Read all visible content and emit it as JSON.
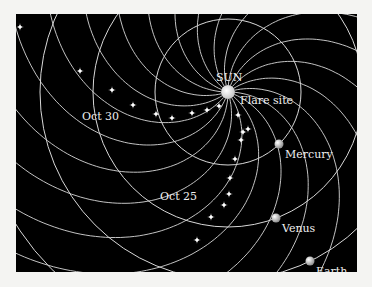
{
  "diagram": {
    "background": "#000000",
    "line_color": "#d8d8d8",
    "sun": {
      "label": "SUN",
      "cx": 228,
      "cy": 92,
      "r": 7,
      "color": "#e8e8e8"
    },
    "flare_label": "Flare site",
    "orbits": [
      {
        "name": "Mercury",
        "r": 73
      },
      {
        "name": "Venus",
        "r": 135
      },
      {
        "name": "Earth",
        "r": 188
      },
      {
        "name": "",
        "r": 250
      }
    ],
    "planets": [
      {
        "label": "Mercury",
        "x": 279,
        "y": 144
      },
      {
        "label": "Venus",
        "x": 276,
        "y": 218
      },
      {
        "label": "Earth",
        "x": 310,
        "y": 261
      }
    ],
    "spiral_count": 20,
    "spiral_k": 143,
    "date_labels": [
      {
        "label": "Oct 30",
        "x": 82,
        "y": 120
      },
      {
        "label": "Oct 25",
        "x": 160,
        "y": 200
      }
    ],
    "stars_oct30": [
      [
        80,
        71
      ],
      [
        112,
        90
      ],
      [
        133,
        105
      ],
      [
        156,
        114
      ],
      [
        172,
        118
      ],
      [
        192,
        113
      ],
      [
        207,
        110
      ],
      [
        219,
        106
      ]
    ],
    "stars_oct25": [
      [
        238,
        115
      ],
      [
        243,
        132
      ],
      [
        248,
        129
      ],
      [
        241,
        140
      ],
      [
        235,
        159
      ],
      [
        230,
        178
      ],
      [
        229,
        194
      ],
      [
        224,
        205
      ],
      [
        211,
        217
      ],
      [
        197,
        240
      ]
    ],
    "stars_other": [
      [
        20,
        27
      ]
    ]
  }
}
